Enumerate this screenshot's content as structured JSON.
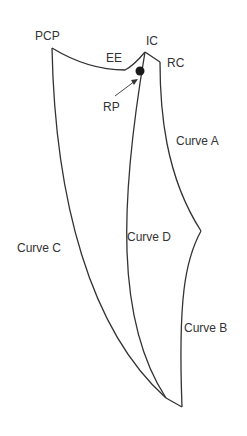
{
  "diagram": {
    "labels": {
      "pcp": "PCP",
      "ee": "EE",
      "ic": "IC",
      "rc": "RC",
      "rp": "RP",
      "curve_a": "Curve A",
      "curve_b": "Curve B",
      "curve_c": "Curve C",
      "curve_d": "Curve D"
    },
    "colors": {
      "line": "#333333",
      "dot": "#1a1a1a",
      "background": "#ffffff"
    }
  }
}
